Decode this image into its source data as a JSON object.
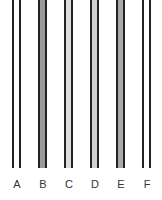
{
  "diagram": {
    "strips": [
      {
        "label": "A",
        "x": 12,
        "fill": "#ffffff"
      },
      {
        "label": "B",
        "x": 38,
        "fill": "#9a9a9a"
      },
      {
        "label": "C",
        "x": 64,
        "fill": "#dcdcdc"
      },
      {
        "label": "D",
        "x": 90,
        "fill": "#d0d0d0"
      },
      {
        "label": "E",
        "x": 116,
        "fill": "#a8a8a8"
      },
      {
        "label": "F",
        "x": 142,
        "fill": "#ffffff"
      }
    ]
  }
}
